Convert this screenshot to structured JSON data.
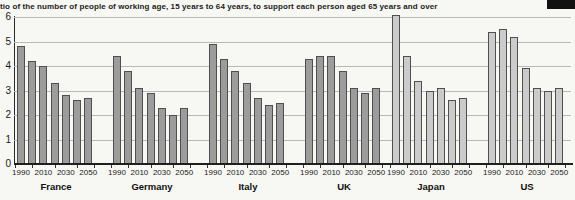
{
  "title": "tio of the number of people of working age, 15 years to 64 years, to support each person aged 65 years and over",
  "colors": {
    "bar_dark": "#9c9c9c",
    "bar_light": "#cbcbcb",
    "bar_border": "#4f4f4f",
    "grid": "#b8b8b8",
    "axis": "#1f1f1f",
    "page_bg": "#f7f7f4"
  },
  "artifacts": {
    "black_box_top_right": true
  },
  "chart_data": {
    "type": "bar",
    "title": "tio of the number of people of working age, 15 years to 64 years, to support each person aged 65 years and over",
    "xlabel": "",
    "ylabel": "",
    "ylim": [
      0,
      6
    ],
    "yticks": [
      0,
      1,
      2,
      3,
      4,
      5,
      6
    ],
    "grid": true,
    "legend": "none",
    "years": [
      "1990",
      "2000",
      "2010",
      "2020",
      "2030",
      "2040",
      "2050"
    ],
    "visible_year_ticks": [
      "1990",
      "2010",
      "2030",
      "2050"
    ],
    "series": [
      {
        "name": "France",
        "shade": "dark",
        "values": [
          4.8,
          4.2,
          4.0,
          3.3,
          2.8,
          2.6,
          2.7
        ]
      },
      {
        "name": "Germany",
        "shade": "dark",
        "values": [
          4.4,
          3.8,
          3.1,
          2.9,
          2.3,
          2.0,
          2.3
        ]
      },
      {
        "name": "Italy",
        "shade": "dark",
        "values": [
          4.9,
          4.3,
          3.8,
          3.3,
          2.7,
          2.4,
          2.5
        ]
      },
      {
        "name": "UK",
        "shade": "dark",
        "values": [
          4.3,
          4.4,
          4.4,
          3.8,
          3.1,
          2.9,
          3.1
        ]
      },
      {
        "name": "Japan",
        "shade": "light",
        "values": [
          6.1,
          4.4,
          3.4,
          3.0,
          3.1,
          2.6,
          2.7
        ]
      },
      {
        "name": "US",
        "shade": "light",
        "values": [
          5.4,
          5.5,
          5.2,
          3.9,
          3.1,
          3.0,
          3.1
        ]
      }
    ]
  }
}
